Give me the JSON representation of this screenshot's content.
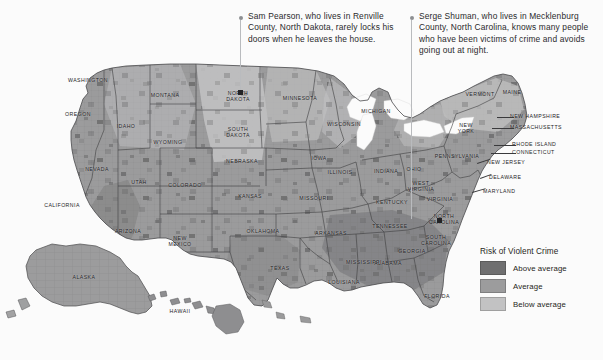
{
  "figure": {
    "kind": "choropleth-map",
    "region": "United States (county level)"
  },
  "annotations": [
    {
      "id": "sam-pearson",
      "text": "Sam Pearson, who lives in Renville County, North Dakota, rarely locks his doors when he leaves the house.",
      "points_to": "Renville County, North Dakota"
    },
    {
      "id": "serge-shuman",
      "text": "Serge Shuman, who lives in Mecklenburg County, North Carolina, knows many people who have been victims of crime and avoids going out at night.",
      "points_to": "Mecklenburg County, North Carolina"
    }
  ],
  "legend": {
    "title": "Risk of Violent Crime",
    "items": [
      {
        "label": "Above average",
        "color": "#6f6f70"
      },
      {
        "label": "Average",
        "color": "#9c9c9d"
      },
      {
        "label": "Below average",
        "color": "#c2c2c3"
      }
    ]
  },
  "map_labels": [
    {
      "text": "WASHINGTON",
      "x": 88,
      "y": 80
    },
    {
      "text": "OREGON",
      "x": 78,
      "y": 114
    },
    {
      "text": "IDAHO",
      "x": 126,
      "y": 126
    },
    {
      "text": "MONTANA",
      "x": 165,
      "y": 95
    },
    {
      "text": "NEVADA",
      "x": 97,
      "y": 169
    },
    {
      "text": "UTAH",
      "x": 139,
      "y": 182
    },
    {
      "text": "WYOMING",
      "x": 168,
      "y": 142
    },
    {
      "text": "COLORADO",
      "x": 185,
      "y": 185
    },
    {
      "text": "CALIFORNIA",
      "x": 62,
      "y": 205
    },
    {
      "text": "ARIZONA",
      "x": 128,
      "y": 231
    },
    {
      "text": "NEW\nMEXICO",
      "x": 180,
      "y": 241
    },
    {
      "text": "NORTH\nDAKOTA",
      "x": 238,
      "y": 96
    },
    {
      "text": "SOUTH\nDAKOTA",
      "x": 238,
      "y": 132
    },
    {
      "text": "NEBRASKA",
      "x": 242,
      "y": 161
    },
    {
      "text": "KANSAS",
      "x": 250,
      "y": 196
    },
    {
      "text": "OKLAHOMA",
      "x": 263,
      "y": 231
    },
    {
      "text": "TEXAS",
      "x": 280,
      "y": 268
    },
    {
      "text": "MINNESOTA",
      "x": 300,
      "y": 98
    },
    {
      "text": "IOWA",
      "x": 319,
      "y": 158
    },
    {
      "text": "MISSOURI",
      "x": 314,
      "y": 198
    },
    {
      "text": "ARKANSAS",
      "x": 331,
      "y": 233
    },
    {
      "text": "LOUISIANA",
      "x": 344,
      "y": 282
    },
    {
      "text": "WISCONSIN",
      "x": 344,
      "y": 124
    },
    {
      "text": "ILLINOIS",
      "x": 340,
      "y": 172
    },
    {
      "text": "MICHIGAN",
      "x": 376,
      "y": 111
    },
    {
      "text": "INDIANA",
      "x": 386,
      "y": 171
    },
    {
      "text": "OHIO",
      "x": 414,
      "y": 169
    },
    {
      "text": "KENTUCKY",
      "x": 392,
      "y": 202
    },
    {
      "text": "TENNESSEE",
      "x": 390,
      "y": 226
    },
    {
      "text": "MISSISSIPPI",
      "x": 364,
      "y": 262
    },
    {
      "text": "ALABAMA",
      "x": 388,
      "y": 263
    },
    {
      "text": "GEORGIA",
      "x": 412,
      "y": 251
    },
    {
      "text": "FLORIDA",
      "x": 437,
      "y": 296
    },
    {
      "text": "SOUTH\nCAROLINA",
      "x": 436,
      "y": 240
    },
    {
      "text": "NORTH\nCAROLINA",
      "x": 444,
      "y": 219
    },
    {
      "text": "VIRGINIA",
      "x": 440,
      "y": 199
    },
    {
      "text": "WEST\nVIRGINIA",
      "x": 421,
      "y": 186
    },
    {
      "text": "PENNSYLVANIA",
      "x": 457,
      "y": 156
    },
    {
      "text": "NEW\nYORK",
      "x": 466,
      "y": 128
    },
    {
      "text": "VERMONT",
      "x": 480,
      "y": 94
    },
    {
      "text": "MAINE",
      "x": 512,
      "y": 92
    },
    {
      "text": "ALASKA",
      "x": 84,
      "y": 277
    },
    {
      "text": "HAWAII",
      "x": 180,
      "y": 311
    }
  ],
  "map_labels_right": [
    {
      "text": "NEW HAMPSHIRE",
      "x": 510,
      "y": 116
    },
    {
      "text": "MASSACHUSETTS",
      "x": 510,
      "y": 127
    },
    {
      "text": "RHODE ISLAND",
      "x": 512,
      "y": 144
    },
    {
      "text": "CONNECTICUT",
      "x": 512,
      "y": 152
    },
    {
      "text": "NEW JERSEY",
      "x": 487,
      "y": 162
    },
    {
      "text": "DELAWARE",
      "x": 489,
      "y": 177
    },
    {
      "text": "MARYLAND",
      "x": 483,
      "y": 191
    }
  ]
}
